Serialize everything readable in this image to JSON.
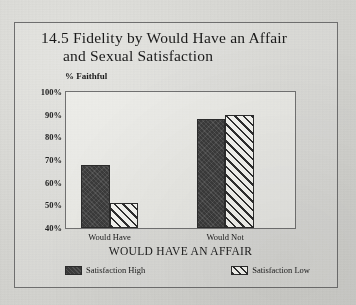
{
  "figure": {
    "title_line1": "14.5 Fidelity by Would Have an Affair",
    "title_line2": "and Sexual Satisfaction"
  },
  "chart_data": {
    "type": "bar",
    "title": "14.5 Fidelity by Would Have an Affair and Sexual Satisfaction",
    "categories": [
      "Would Have",
      "Would Not"
    ],
    "series": [
      {
        "name": "Satisfaction High",
        "values": [
          68,
          88
        ],
        "style": "solid-dark"
      },
      {
        "name": "Satisfaction Low",
        "values": [
          51,
          90
        ],
        "style": "diagonal-hatch"
      }
    ],
    "ylabel": "% Faithful",
    "xlabel": "WOULD HAVE AN AFFAIR",
    "ylim": [
      40,
      100
    ],
    "yticks": [
      "100%",
      "90%",
      "80%",
      "70%",
      "60%",
      "50%",
      "40%"
    ],
    "ytick_values": [
      100,
      90,
      80,
      70,
      60,
      50,
      40
    ],
    "grid": false,
    "legend_position": "bottom",
    "colors": {
      "high": "#3a3a3a",
      "low": "#f2f2ee",
      "hatch": "#2e2e2e",
      "frame": "#707070"
    }
  }
}
